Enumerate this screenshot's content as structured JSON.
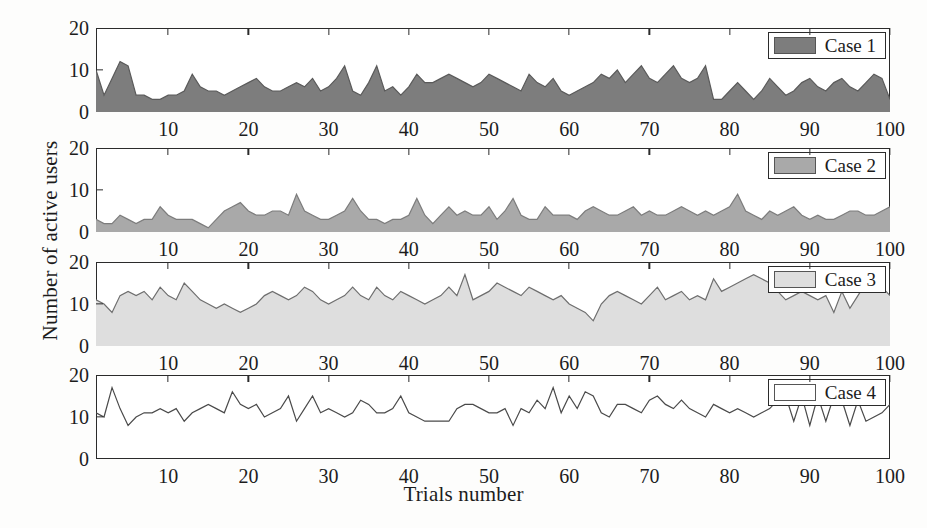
{
  "chart_data": {
    "type": "area",
    "title": "",
    "xlabel": "Trials number",
    "ylabel": "Number of active users",
    "xlim": [
      1,
      100
    ],
    "ylim": [
      0,
      20
    ],
    "yticks": [
      0,
      10,
      20
    ],
    "xticks": [
      10,
      20,
      30,
      40,
      50,
      60,
      70,
      80,
      90,
      100
    ],
    "grid": false,
    "legend_position": "top-right of each panel",
    "panels": [
      {
        "name": "Case 1",
        "fill": "#7d7d7d",
        "line": "#5a5a5a",
        "filled": true,
        "values": [
          10,
          4,
          8,
          12,
          11,
          4,
          4,
          3,
          3,
          4,
          4,
          5,
          9,
          6,
          5,
          5,
          4,
          5,
          6,
          7,
          8,
          6,
          5,
          5,
          6,
          7,
          6,
          8,
          5,
          6,
          8,
          11,
          5,
          4,
          7,
          11,
          5,
          6,
          4,
          6,
          9,
          7,
          7,
          8,
          9,
          8,
          7,
          6,
          7,
          9,
          8,
          7,
          6,
          5,
          9,
          7,
          6,
          8,
          5,
          4,
          5,
          6,
          7,
          9,
          8,
          10,
          7,
          9,
          11,
          8,
          7,
          9,
          11,
          8,
          7,
          8,
          11,
          3,
          3,
          5,
          7,
          5,
          3,
          5,
          8,
          6,
          4,
          5,
          7,
          8,
          6,
          5,
          7,
          8,
          6,
          5,
          7,
          9,
          8,
          3
        ]
      },
      {
        "name": "Case 2",
        "fill": "#a9a9a9",
        "line": "#7c7c7c",
        "filled": true,
        "values": [
          3,
          2,
          2,
          4,
          3,
          2,
          3,
          3,
          6,
          4,
          3,
          3,
          3,
          2,
          1,
          3,
          5,
          6,
          7,
          5,
          4,
          4,
          5,
          5,
          4,
          9,
          5,
          4,
          3,
          3,
          4,
          5,
          8,
          5,
          3,
          3,
          2,
          3,
          3,
          4,
          8,
          4,
          2,
          4,
          6,
          4,
          5,
          4,
          4,
          6,
          3,
          5,
          8,
          4,
          3,
          3,
          6,
          4,
          4,
          4,
          3,
          5,
          6,
          5,
          4,
          4,
          5,
          6,
          4,
          5,
          4,
          4,
          5,
          6,
          5,
          4,
          5,
          4,
          5,
          6,
          9,
          5,
          4,
          3,
          5,
          4,
          5,
          6,
          4,
          3,
          4,
          3,
          3,
          4,
          5,
          5,
          4,
          4,
          5,
          6
        ]
      },
      {
        "name": "Case 3",
        "fill": "#dedede",
        "line": "#6e6e6e",
        "filled": true,
        "values": [
          11,
          10,
          8,
          12,
          13,
          12,
          13,
          11,
          14,
          12,
          11,
          15,
          13,
          11,
          10,
          9,
          10,
          9,
          8,
          9,
          10,
          12,
          13,
          12,
          11,
          12,
          14,
          13,
          11,
          10,
          11,
          12,
          14,
          12,
          11,
          14,
          12,
          11,
          13,
          12,
          11,
          10,
          11,
          12,
          14,
          12,
          17,
          11,
          12,
          13,
          15,
          14,
          13,
          12,
          14,
          13,
          12,
          11,
          12,
          10,
          9,
          8,
          6,
          10,
          12,
          13,
          12,
          11,
          10,
          12,
          14,
          11,
          12,
          13,
          11,
          12,
          11,
          16,
          13,
          14,
          15,
          16,
          17,
          16,
          15,
          13,
          11,
          12,
          13,
          12,
          11,
          12,
          8,
          13,
          9,
          12,
          15,
          13,
          14,
          12
        ]
      },
      {
        "name": "Case 4",
        "fill": "#ffffff",
        "line": "#4a4a4a",
        "filled": false,
        "values": [
          11,
          10,
          17,
          12,
          8,
          10,
          11,
          11,
          12,
          11,
          12,
          9,
          11,
          12,
          13,
          12,
          11,
          16,
          13,
          12,
          13,
          10,
          11,
          12,
          15,
          9,
          12,
          15,
          11,
          12,
          11,
          10,
          11,
          14,
          13,
          11,
          11,
          12,
          15,
          11,
          10,
          9,
          9,
          9,
          9,
          12,
          13,
          13,
          12,
          11,
          11,
          12,
          8,
          12,
          11,
          14,
          12,
          17,
          11,
          15,
          12,
          16,
          15,
          11,
          10,
          13,
          13,
          12,
          11,
          14,
          15,
          13,
          12,
          14,
          12,
          11,
          10,
          13,
          12,
          11,
          12,
          11,
          10,
          11,
          12,
          14,
          15,
          9,
          15,
          8,
          15,
          9,
          15,
          14,
          8,
          14,
          9,
          10,
          11,
          13
        ]
      }
    ]
  }
}
